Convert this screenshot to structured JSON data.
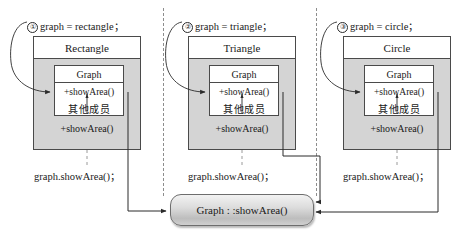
{
  "figure": {
    "top_clipped_line": "",
    "target_box": {
      "label": "Graph : :showArea()"
    }
  },
  "panels": [
    {
      "id": "panel-rectangle",
      "marker": "①",
      "caption": "graph = rectangle；",
      "derived_class": "Rectangle",
      "base_class": "Graph",
      "base_members": [
        "+showArea()",
        "其他成员"
      ],
      "derived_method": "+showArea()",
      "call_site": "graph.showArea()；"
    },
    {
      "id": "panel-triangle",
      "marker": "②",
      "caption": "graph = triangle；",
      "derived_class": "Triangle",
      "base_class": "Graph",
      "base_members": [
        "+showArea()",
        "其他成员"
      ],
      "derived_method": "+showArea()",
      "call_site": "graph.showArea()；"
    },
    {
      "id": "panel-circle",
      "marker": "③",
      "caption": "graph = circle；",
      "derived_class": "Circle",
      "base_class": "Graph",
      "base_members": [
        "+showArea()",
        "其他成员"
      ],
      "derived_method": "+showArea()",
      "call_site": "graph.showArea()；"
    }
  ],
  "colors": {
    "outer_fill": "#d4d4d4",
    "inner_fill": "#ffffff",
    "stroke": "#4a4a4a",
    "divider": "#8d8d8d",
    "target_stroke": "#6d6d6d"
  }
}
